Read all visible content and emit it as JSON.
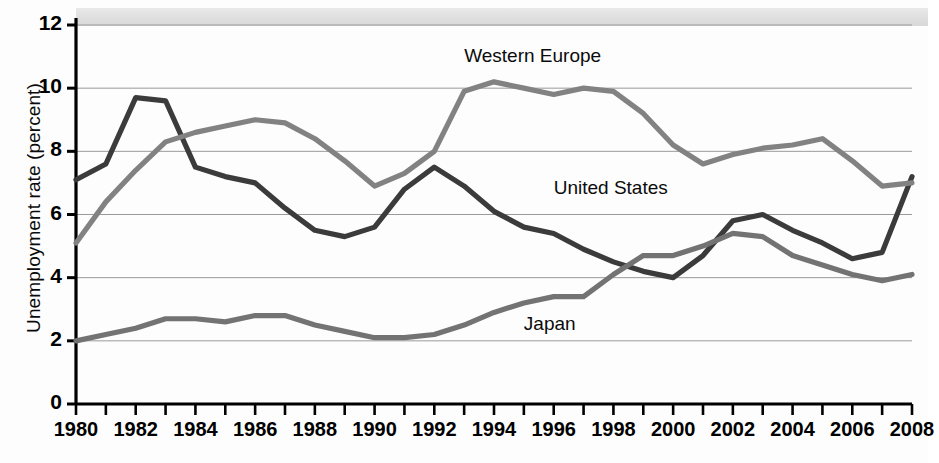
{
  "chart_data": {
    "type": "line",
    "title": "",
    "xlabel": "",
    "ylabel": "Unemployment rate (percent)",
    "ylim": [
      0,
      12
    ],
    "xlim": [
      1980,
      2008
    ],
    "y_ticks": [
      0,
      2,
      4,
      6,
      8,
      10,
      12
    ],
    "x_ticks": [
      1980,
      1981,
      1982,
      1983,
      1984,
      1985,
      1986,
      1987,
      1988,
      1989,
      1990,
      1991,
      1992,
      1993,
      1994,
      1995,
      1996,
      1997,
      1998,
      1999,
      2000,
      2001,
      2002,
      2003,
      2004,
      2005,
      2006,
      2007,
      2008
    ],
    "x_tick_labels": [
      "1980",
      "1982",
      "1984",
      "1986",
      "1988",
      "1990",
      "1992",
      "1994",
      "1996",
      "1998",
      "2000",
      "2002",
      "2004",
      "2006",
      "2008"
    ],
    "grid": "horizontal",
    "legend_position": "inline-annotations",
    "x": [
      1980,
      1981,
      1982,
      1983,
      1984,
      1985,
      1986,
      1987,
      1988,
      1989,
      1990,
      1991,
      1992,
      1993,
      1994,
      1995,
      1996,
      1997,
      1998,
      1999,
      2000,
      2001,
      2002,
      2003,
      2004,
      2005,
      2006,
      2007,
      2008
    ],
    "series": [
      {
        "name": "United States",
        "color": "#3b3b3b",
        "values": [
          7.1,
          7.6,
          9.7,
          9.6,
          7.5,
          7.2,
          7.0,
          6.2,
          5.5,
          5.3,
          5.6,
          6.8,
          7.5,
          6.9,
          6.1,
          5.6,
          5.4,
          4.9,
          4.5,
          4.2,
          4.0,
          4.7,
          5.8,
          6.0,
          5.5,
          5.1,
          4.6,
          4.8,
          7.2
        ]
      },
      {
        "name": "Western Europe",
        "color": "#828282",
        "values": [
          5.1,
          6.4,
          7.4,
          8.3,
          8.6,
          8.8,
          9.0,
          8.9,
          8.4,
          7.7,
          6.9,
          7.3,
          8.0,
          9.9,
          10.2,
          10.0,
          9.8,
          10.0,
          9.9,
          9.2,
          8.2,
          7.6,
          7.9,
          8.1,
          8.2,
          8.4,
          7.7,
          6.9,
          7.0
        ]
      },
      {
        "name": "Japan",
        "color": "#737373",
        "values": [
          2.0,
          2.2,
          2.4,
          2.7,
          2.7,
          2.6,
          2.8,
          2.8,
          2.5,
          2.3,
          2.1,
          2.1,
          2.2,
          2.5,
          2.9,
          3.2,
          3.4,
          3.4,
          4.1,
          4.7,
          4.7,
          5.0,
          5.4,
          5.3,
          4.7,
          4.4,
          4.1,
          3.9,
          4.1
        ]
      }
    ],
    "annotations": [
      {
        "text": "Western Europe",
        "at_x": 1993,
        "at_y": 11.0
      },
      {
        "text": "United States",
        "at_x": 1996,
        "at_y": 6.8
      },
      {
        "text": "Japan",
        "at_x": 1995,
        "at_y": 2.5
      }
    ]
  }
}
